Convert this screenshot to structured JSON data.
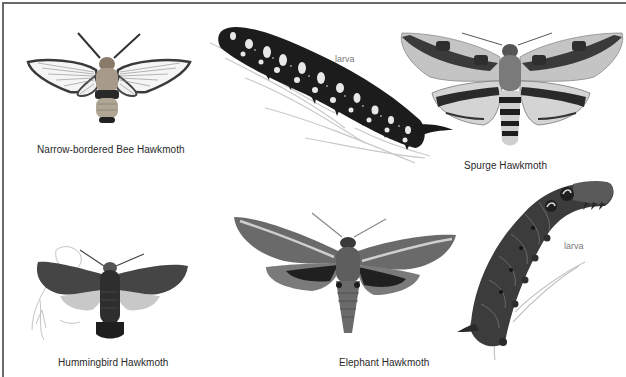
{
  "plate": {
    "background": "#ffffff",
    "border_color": "#6a6a6a",
    "specimens": [
      {
        "id": "narrow-bordered-bee-hawkmoth",
        "caption": "Narrow-bordered Bee Hawkmoth",
        "stage": "adult"
      },
      {
        "id": "spurge-hawkmoth-larva",
        "label": "larva",
        "stage": "larva"
      },
      {
        "id": "spurge-hawkmoth",
        "caption": "Spurge Hawkmoth",
        "stage": "adult"
      },
      {
        "id": "hummingbird-hawkmoth",
        "caption": "Hummingbird Hawkmoth",
        "stage": "adult"
      },
      {
        "id": "elephant-hawkmoth",
        "caption": "Elephant Hawkmoth",
        "stage": "adult"
      },
      {
        "id": "elephant-hawkmoth-larva",
        "label": "larva",
        "stage": "larva"
      }
    ]
  }
}
